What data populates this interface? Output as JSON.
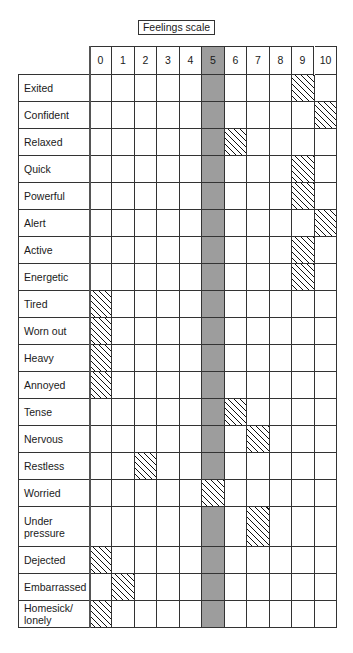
{
  "title": "Feelings scale",
  "chart_data": {
    "type": "table",
    "title": "Feelings scale",
    "columns": [
      "0",
      "1",
      "2",
      "3",
      "4",
      "5",
      "6",
      "7",
      "8",
      "9",
      "10"
    ],
    "highlighted_column": "5",
    "highlight_color": "#9d9d9d",
    "marker": "hatched cell",
    "rows": [
      {
        "label": "Exited",
        "value": 9
      },
      {
        "label": "Confident",
        "value": 10
      },
      {
        "label": "Relaxed",
        "value": 6
      },
      {
        "label": "Quick",
        "value": 9
      },
      {
        "label": "Powerful",
        "value": 9
      },
      {
        "label": "Alert",
        "value": 10
      },
      {
        "label": "Active",
        "value": 9
      },
      {
        "label": "Energetic",
        "value": 9
      },
      {
        "label": "Tired",
        "value": 0
      },
      {
        "label": "Worn out",
        "value": 0
      },
      {
        "label": "Heavy",
        "value": 0
      },
      {
        "label": "Annoyed",
        "value": 0
      },
      {
        "label": "Tense",
        "value": 6
      },
      {
        "label": "Nervous",
        "value": 7
      },
      {
        "label": "Restless",
        "value": 2
      },
      {
        "label": "Worried",
        "value": 5
      },
      {
        "label": "Under pressure",
        "value": 7,
        "tall": true
      },
      {
        "label": "Dejected",
        "value": 0
      },
      {
        "label": "Embarrassed",
        "value": 1
      },
      {
        "label": "Homesick/ lonely",
        "value": 0
      }
    ]
  }
}
